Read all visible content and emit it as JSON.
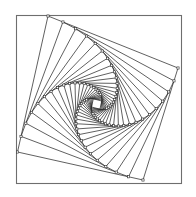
{
  "figure": {
    "canvas": {
      "width": 196,
      "height": 197,
      "background": "#ffffff"
    },
    "frame": {
      "name": "bounding-frame",
      "x": 16.5,
      "y": 15.5,
      "width": 165,
      "height": 168,
      "stroke": "#6e6e6e",
      "stroke_width": 1.1,
      "fill": "#ffffff"
    },
    "spiral": {
      "description": "Nested rotating quadrilaterals; each successive square's vertices lie on the edges of the previous square at a fixed fractional offset, producing an inward logarithmic spiral.",
      "iterations": 25,
      "ratio": 0.115,
      "rotation_direction": "clockwise-inward",
      "stroke": "#2b2b2b",
      "stroke_width": 0.75,
      "fill": "none",
      "start_square": [
        {
          "x": 48.0,
          "y": 16.0
        },
        {
          "x": 178.0,
          "y": 68.0
        },
        {
          "x": 143.0,
          "y": 180.0
        },
        {
          "x": 17.5,
          "y": 152.0
        }
      ],
      "vertex_marker": {
        "name": "vertex-marker",
        "shape": "square",
        "size": 2.2,
        "fill": "#ffffff",
        "stroke": "#2b2b2b",
        "stroke_width": 0.6,
        "drawn_for_iterations": 20
      }
    }
  }
}
